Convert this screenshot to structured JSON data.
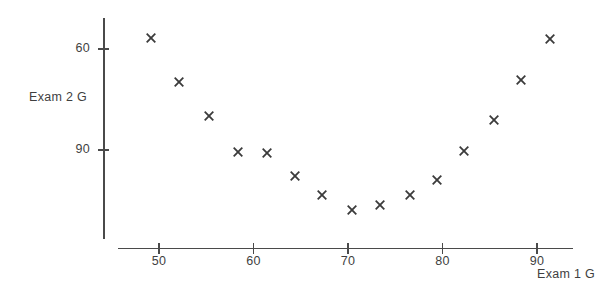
{
  "chart_data": {
    "type": "scatter",
    "title": "",
    "xlabel": "Exam 1 G",
    "ylabel": "Exam 2 G",
    "xticks": [
      50,
      60,
      70,
      80,
      90
    ],
    "yticks": [
      60,
      90
    ],
    "xlim": [
      45.5,
      93.5
    ],
    "ylim": [
      37,
      97
    ],
    "grid": false,
    "legend": null,
    "marker": "x",
    "marker_color": "#3b3b3b",
    "series": [
      {
        "name": "",
        "points": [
          {
            "x": 49.2,
            "y": 93.3
          },
          {
            "x": 52.1,
            "y": 80.3
          },
          {
            "x": 55.3,
            "y": 70.2
          },
          {
            "x": 58.4,
            "y": 59.5
          },
          {
            "x": 61.4,
            "y": 59.2
          },
          {
            "x": 64.4,
            "y": 52.4
          },
          {
            "x": 67.3,
            "y": 46.7
          },
          {
            "x": 70.4,
            "y": 42.3
          },
          {
            "x": 73.4,
            "y": 43.8
          },
          {
            "x": 76.6,
            "y": 46.7
          },
          {
            "x": 79.4,
            "y": 51.2
          },
          {
            "x": 82.3,
            "y": 59.8
          },
          {
            "x": 85.5,
            "y": 69.0
          },
          {
            "x": 88.3,
            "y": 80.9
          },
          {
            "x": 91.4,
            "y": 93.0
          }
        ]
      }
    ],
    "xtick_labels": [
      "50",
      "60",
      "70",
      "80",
      "90"
    ],
    "ytick_labels": [
      "90",
      "60"
    ]
  },
  "axes": {
    "x_title": "Exam 1 G",
    "y_title": "Exam 2 G"
  },
  "colors": {
    "axis": "#4a4a4a",
    "marker": "#3b3b3b",
    "text": "#3f3f3f",
    "background": "#ffffff"
  }
}
